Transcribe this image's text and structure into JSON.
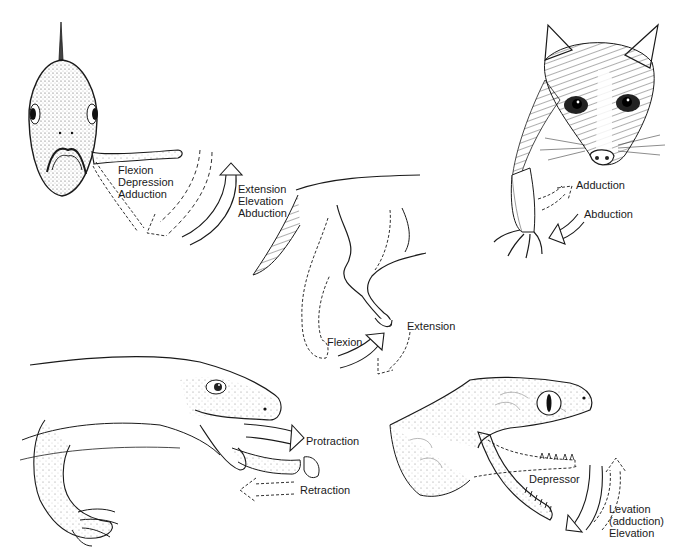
{
  "figure": {
    "panels": [
      {
        "id": "fish",
        "subject": "fish (front view) with pectoral fin",
        "labels": {
          "dashed_arrow": [
            "Flexion",
            "Depression",
            "Adduction"
          ],
          "solid_arrow": [
            "Extension",
            "Elevation",
            "Abduction"
          ]
        }
      },
      {
        "id": "opossum",
        "subject": "opossum forelimb",
        "labels": {
          "dashed_arrow": "Adduction",
          "solid_arrow": "Abduction"
        }
      },
      {
        "id": "dog",
        "subject": "dog hind limb (lateral view)",
        "labels": {
          "solid_arrow": "Flexion",
          "dashed_arrow": "Extension"
        }
      },
      {
        "id": "lizard",
        "subject": "lizard tongue",
        "labels": {
          "solid_arrow": "Protraction",
          "dashed_arrow": "Retraction"
        }
      },
      {
        "id": "snake",
        "subject": "snake jaw",
        "labels": {
          "muscle": "Depressor",
          "dashed_arrow": [
            "Levation",
            "(adduction)",
            "Elevation"
          ]
        }
      }
    ]
  },
  "colors": {
    "ink": "#1a1a1a",
    "background": "#ffffff",
    "stipple": "#8a8a8a"
  }
}
